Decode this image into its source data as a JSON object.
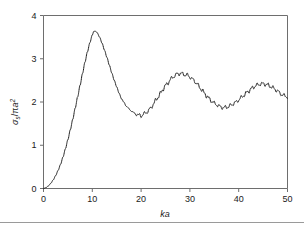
{
  "chart_data": {
    "type": "line",
    "title": "",
    "subtitle": "",
    "xlabel": "ka",
    "ylabel": "σs/πa2",
    "ylabel_parts": {
      "sigma": "σ",
      "sigma_sub": "s",
      "slash": "/",
      "pi": "π",
      "a": "a",
      "a_sup": "2"
    },
    "xlim": [
      0,
      50
    ],
    "ylim": [
      0,
      4
    ],
    "xticks": [
      0,
      10,
      20,
      30,
      40,
      50
    ],
    "yticks": [
      0,
      1,
      2,
      3,
      4
    ],
    "xtick_labels": [
      "0",
      "10",
      "20",
      "30",
      "40",
      "50"
    ],
    "ytick_labels": [
      "0",
      "1",
      "2",
      "3",
      "4"
    ],
    "grid": false,
    "legend": false,
    "legend_position": "none",
    "line_style": "dotted",
    "line_color": "#1c1c1c",
    "frame_color": "#6e6e6e",
    "annotations": [],
    "series": [
      {
        "name": "scattering cross-section",
        "x": [
          0.0,
          0.5,
          1.0,
          1.5,
          2.0,
          2.5,
          3.0,
          3.5,
          4.0,
          4.5,
          5.0,
          5.5,
          6.0,
          6.5,
          7.0,
          7.5,
          8.0,
          8.5,
          9.0,
          9.5,
          10.0,
          10.3,
          10.6,
          11.0,
          11.5,
          12.0,
          12.5,
          13.0,
          13.5,
          14.0,
          14.5,
          15.0,
          15.5,
          16.0,
          16.5,
          17.0,
          17.5,
          18.0,
          18.5,
          19.0,
          19.5,
          20.0,
          20.5,
          21.0,
          21.5,
          22.0,
          22.5,
          23.0,
          23.5,
          24.0,
          24.5,
          25.0,
          25.5,
          26.0,
          26.5,
          27.0,
          27.5,
          28.0,
          28.5,
          29.0,
          29.5,
          30.0,
          30.5,
          31.0,
          31.5,
          32.0,
          32.5,
          33.0,
          33.5,
          34.0,
          34.5,
          35.0,
          35.5,
          36.0,
          36.5,
          37.0,
          37.5,
          38.0,
          38.5,
          39.0,
          39.5,
          40.0,
          40.5,
          41.0,
          41.5,
          42.0,
          42.5,
          43.0,
          43.5,
          44.0,
          44.5,
          45.0,
          45.5,
          46.0,
          46.5,
          47.0,
          47.5,
          48.0,
          48.5,
          49.0,
          49.5,
          50.0
        ],
        "y": [
          0.0,
          0.02,
          0.06,
          0.12,
          0.2,
          0.3,
          0.42,
          0.56,
          0.73,
          0.92,
          1.13,
          1.36,
          1.6,
          1.86,
          2.12,
          2.39,
          2.66,
          2.92,
          3.16,
          3.37,
          3.55,
          3.63,
          3.64,
          3.6,
          3.5,
          3.36,
          3.2,
          3.03,
          2.85,
          2.67,
          2.5,
          2.35,
          2.2,
          2.07,
          1.99,
          1.9,
          1.84,
          1.8,
          1.74,
          1.72,
          1.7,
          1.68,
          1.72,
          1.75,
          1.8,
          1.86,
          1.95,
          2.04,
          2.12,
          2.2,
          2.3,
          2.38,
          2.44,
          2.52,
          2.57,
          2.62,
          2.65,
          2.66,
          2.65,
          2.63,
          2.62,
          2.58,
          2.53,
          2.48,
          2.41,
          2.34,
          2.27,
          2.2,
          2.13,
          2.07,
          2.02,
          1.97,
          1.94,
          1.9,
          1.88,
          1.87,
          1.88,
          1.9,
          1.93,
          1.97,
          2.0,
          2.05,
          2.1,
          2.15,
          2.2,
          2.25,
          2.3,
          2.34,
          2.38,
          2.4,
          2.42,
          2.42,
          2.41,
          2.39,
          2.36,
          2.33,
          2.29,
          2.25,
          2.2,
          2.16,
          2.14,
          2.12
        ],
        "ripple_amplitude": 0.035,
        "ripple_period_ka": 1.1,
        "ripple_onset_ka": 16.0
      }
    ],
    "features": {
      "main_peak": {
        "ka": 10.3,
        "value": 3.64
      },
      "first_minimum": {
        "ka": 20.0,
        "value": 1.68
      },
      "second_peak": {
        "ka": 28.0,
        "value": 2.66
      },
      "second_minimum": {
        "ka": 37.0,
        "value": 1.87
      },
      "third_peak": {
        "ka": 45.0,
        "value": 2.42
      },
      "endpoint": {
        "ka": 50.0,
        "value": 2.12
      }
    }
  }
}
